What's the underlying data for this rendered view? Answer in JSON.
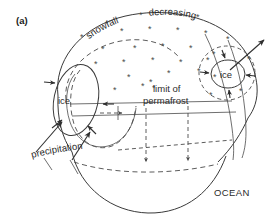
{
  "figure": {
    "panel_label": "(a)",
    "type": "schematic-diagram",
    "background_color": "#ffffff",
    "line_color": "#3a3a3a",
    "text_color": "#2b2b2b"
  },
  "labels": {
    "snowfall": "snowfall",
    "decreasing": "decreasing",
    "limit_of": "limit of",
    "permafrost": "permafrost",
    "precipitation": "precipitation",
    "ocean": "OCEAN",
    "ice_left": "ice",
    "ice_right": "ice",
    "snowflake_glyph": "*"
  },
  "chart_data": {
    "type": "diagram",
    "title": "(a)",
    "annotations": [
      {
        "name": "snowfall",
        "text": "snowfall",
        "x": 105,
        "y": 22
      },
      {
        "name": "decreasing",
        "text": "decreasing",
        "x": 168,
        "y": 20
      },
      {
        "name": "limit-of",
        "text": "limit of",
        "x": 172,
        "y": 88
      },
      {
        "name": "permafrost",
        "text": "permafrost",
        "x": 170,
        "y": 101
      },
      {
        "name": "precipitation",
        "text": "precipitation",
        "x": 62,
        "y": 153
      },
      {
        "name": "ocean",
        "text": "OCEAN",
        "x": 233,
        "y": 190
      },
      {
        "name": "ice-left",
        "text": "ice",
        "x": 67,
        "y": 102
      },
      {
        "name": "ice-right",
        "text": "ice",
        "x": 228,
        "y": 76
      }
    ],
    "snowflakes": [
      {
        "x": 80,
        "y": 38
      },
      "…",
      {
        "x": 120,
        "y": 33
      },
      {
        "x": 148,
        "y": 31
      },
      {
        "x": 176,
        "y": 32
      },
      {
        "x": 204,
        "y": 35
      },
      {
        "x": 224,
        "y": 40
      },
      {
        "x": 100,
        "y": 51
      },
      {
        "x": 133,
        "y": 50
      },
      {
        "x": 160,
        "y": 48
      },
      {
        "x": 188,
        "y": 50
      },
      {
        "x": 212,
        "y": 55
      },
      {
        "x": 94,
        "y": 66
      },
      {
        "x": 122,
        "y": 64
      },
      {
        "x": 150,
        "y": 62
      },
      {
        "x": 178,
        "y": 64
      },
      {
        "x": 206,
        "y": 62
      },
      {
        "x": 126,
        "y": 79
      },
      {
        "x": 148,
        "y": 83
      },
      {
        "x": 176,
        "y": 78
      },
      {
        "x": 196,
        "y": 73
      },
      {
        "x": 112,
        "y": 92
      },
      {
        "x": 140,
        "y": 88
      },
      {
        "x": 208,
        "y": 96
      },
      {
        "x": 246,
        "y": 60
      },
      {
        "x": 238,
        "y": 92
      }
    ],
    "legend_entries": [],
    "grid": false
  },
  "snowflake_positions": [
    {
      "x": 80,
      "y": 40
    },
    {
      "x": 120,
      "y": 34
    },
    {
      "x": 148,
      "y": 32
    },
    {
      "x": 176,
      "y": 33
    },
    {
      "x": 204,
      "y": 36
    },
    {
      "x": 226,
      "y": 42
    },
    {
      "x": 101,
      "y": 52
    },
    {
      "x": 133,
      "y": 51
    },
    {
      "x": 161,
      "y": 49
    },
    {
      "x": 189,
      "y": 51
    },
    {
      "x": 212,
      "y": 57
    },
    {
      "x": 94,
      "y": 67
    },
    {
      "x": 122,
      "y": 65
    },
    {
      "x": 151,
      "y": 63
    },
    {
      "x": 179,
      "y": 65
    },
    {
      "x": 206,
      "y": 63
    },
    {
      "x": 127,
      "y": 80
    },
    {
      "x": 149,
      "y": 85
    },
    {
      "x": 167,
      "y": 76
    },
    {
      "x": 197,
      "y": 74
    },
    {
      "x": 113,
      "y": 93
    },
    {
      "x": 141,
      "y": 89
    },
    {
      "x": 209,
      "y": 98
    },
    {
      "x": 247,
      "y": 62
    },
    {
      "x": 239,
      "y": 94
    },
    {
      "x": 152,
      "y": 91
    },
    {
      "x": 196,
      "y": 20
    },
    {
      "x": 213,
      "y": 80
    }
  ]
}
